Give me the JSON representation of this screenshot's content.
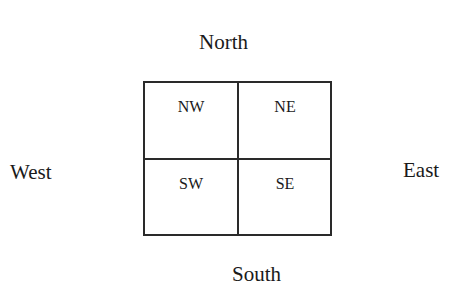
{
  "directions": {
    "north": "North",
    "south": "South",
    "west": "West",
    "east": "East"
  },
  "quadrants": {
    "nw": "NW",
    "ne": "NE",
    "sw": "SW",
    "se": "SE"
  },
  "colors": {
    "line": "#2a2a2a",
    "text": "#1a1a1a",
    "background": "#ffffff"
  }
}
